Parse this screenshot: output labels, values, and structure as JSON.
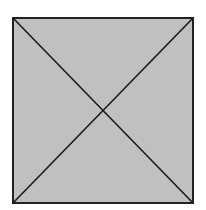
{
  "diagram": {
    "type": "square-with-diagonals",
    "shape": {
      "x": 13,
      "y": 18,
      "width": 180,
      "height": 185,
      "fill": "#c0c0c0",
      "stroke": "#222222",
      "stroke_width": 2
    },
    "diagonals": [
      {
        "x1": 13,
        "y1": 18,
        "x2": 193,
        "y2": 203
      },
      {
        "x1": 193,
        "y1": 18,
        "x2": 13,
        "y2": 203
      }
    ],
    "line_color": "#1a1a1a",
    "line_width": 1.6
  }
}
